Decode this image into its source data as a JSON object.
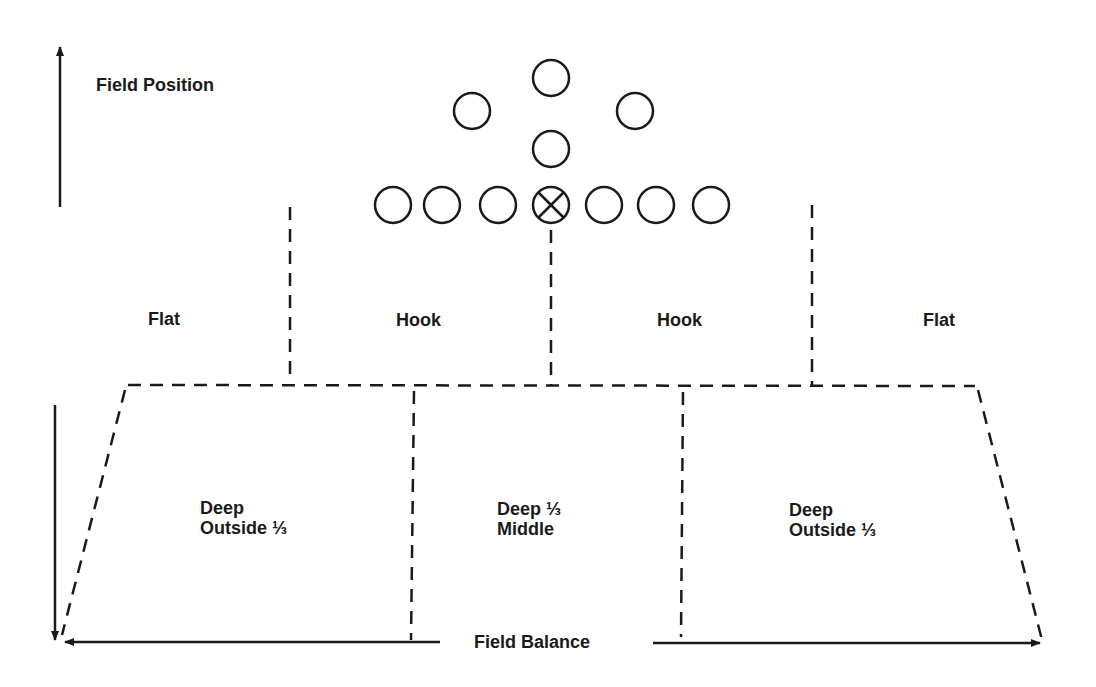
{
  "axes": {
    "vertical_label": "Field Position",
    "horizontal_label": "Field Balance"
  },
  "underneath_zones": [
    {
      "label": "Flat"
    },
    {
      "label": "Hook"
    },
    {
      "label": "Hook"
    },
    {
      "label": "Flat"
    }
  ],
  "deep_zones": [
    {
      "line1": "Deep",
      "line2": "Outside ⅓"
    },
    {
      "line1": "Deep ⅓",
      "line2": "Middle"
    },
    {
      "line1": "Deep",
      "line2": "Outside ⅓"
    }
  ],
  "offense": {
    "line_count": 7,
    "center_marker": "circle-x",
    "backfield_count": 4
  },
  "colors": {
    "ink": "#1a1a1a",
    "background": "#ffffff"
  }
}
